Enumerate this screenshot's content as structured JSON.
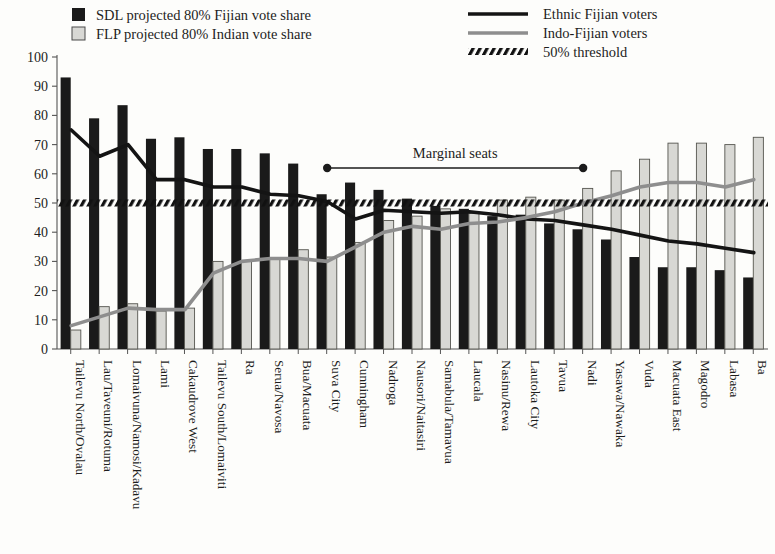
{
  "legend": {
    "items": [
      {
        "id": "sdl-bar",
        "label": "SDL projected 80% Fijian vote share",
        "marker": "filled-square",
        "color": "#1a1a1a"
      },
      {
        "id": "flp-bar",
        "label": "FLP projected 80% Indian vote share",
        "marker": "light-square",
        "color": "#d8d8d4"
      },
      {
        "id": "ethnic-line",
        "label": "Ethnic Fijian voters",
        "marker": "solid-line",
        "color": "#141414"
      },
      {
        "id": "indo-line",
        "label": "Indo-Fijian voters",
        "marker": "solid-line",
        "color": "#8e8e8e"
      },
      {
        "id": "threshold-line",
        "label": "50% threshold",
        "marker": "dashed-line",
        "color": "#121212"
      }
    ]
  },
  "annotations": {
    "marginal_label": "Marginal seats",
    "marginal_from": "Suva City",
    "marginal_to": "Nadi"
  },
  "chart_data": {
    "type": "bar",
    "title": "",
    "xlabel": "",
    "ylabel": "",
    "ylim": [
      0,
      100
    ],
    "yticks": [
      0,
      10,
      20,
      30,
      40,
      50,
      60,
      70,
      80,
      90,
      100
    ],
    "grid": false,
    "legend_position": "top",
    "threshold": 50,
    "categories": [
      "Tailevu North/Ovalau",
      "Lau/Taveuni/Rotuma",
      "Lomaivuna/Namosi/Kadavu",
      "Lami",
      "Cakaudrove West",
      "Tailevu South/Lomaiviti",
      "Ra",
      "Serua/Navosa",
      "Bua/Macuata",
      "Suva City",
      "Cunningham",
      "Nadroga",
      "Nausori/Naitasiri",
      "Samabula/Tamavua",
      "Laucala",
      "Nasinu/Rewa",
      "Lautoka City",
      "Tavua",
      "Nadi",
      "Yasawa/Nawaka",
      "Vuda",
      "Macuata East",
      "Magodro",
      "Labasa",
      "Ba"
    ],
    "series": [
      {
        "name": "SDL projected 80% Fijian vote share",
        "type": "bar",
        "color": "#1a1a1a",
        "values": [
          93,
          79,
          83.5,
          72,
          72.5,
          68.5,
          68.5,
          67,
          63.5,
          53,
          57,
          54.5,
          51.5,
          49,
          48,
          45.5,
          46,
          43,
          41,
          37.5,
          31.5,
          28,
          28,
          27,
          24.5
        ]
      },
      {
        "name": "FLP projected 80% Indian vote share",
        "type": "bar",
        "color": "#d8d8d4",
        "values": [
          6.5,
          14.5,
          15.5,
          13,
          14,
          30,
          30,
          31,
          34,
          31.5,
          36.5,
          44,
          45.5,
          48,
          46.5,
          51,
          52,
          51,
          55,
          61,
          65,
          70.5,
          70.5,
          70,
          72.5
        ]
      },
      {
        "name": "Ethnic Fijian voters",
        "type": "line",
        "color": "#141414",
        "values": [
          75,
          66,
          70,
          58,
          58,
          55.5,
          55.5,
          53,
          52.5,
          50.5,
          44.5,
          47.5,
          47,
          46.5,
          47,
          46,
          44.5,
          44,
          42.5,
          41,
          39,
          37,
          36,
          34.5,
          33
        ]
      },
      {
        "name": "Indo-Fijian voters",
        "type": "line",
        "color": "#8e8e8e",
        "values": [
          8,
          11,
          14,
          13.5,
          13.5,
          26,
          30,
          31,
          31,
          30,
          35,
          40,
          42,
          41,
          43,
          43.5,
          45,
          47,
          50,
          52.5,
          55.5,
          57,
          57,
          55.5,
          58
        ]
      }
    ]
  }
}
